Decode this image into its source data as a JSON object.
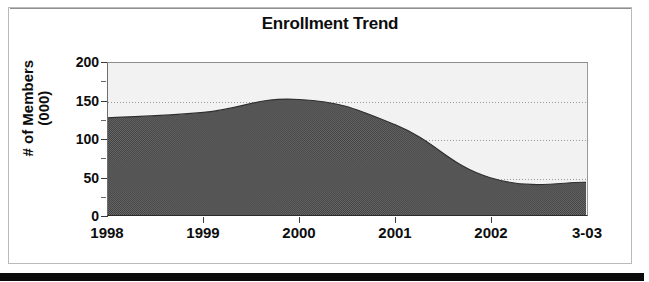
{
  "document": {
    "kind": "scanned-chart-page",
    "bottom_bar_color": "#0b0b0b",
    "frame_color": "#b9b9b9"
  },
  "chart_data": {
    "type": "area",
    "title": "Enrollment Trend",
    "xlabel": "",
    "ylabel": "# of Members\n(000)",
    "categories": [
      "1998",
      "1999",
      "2000",
      "2001",
      "2002",
      "3-03"
    ],
    "values": [
      128,
      135,
      152,
      119,
      49,
      43
    ],
    "ylim": [
      0,
      200
    ],
    "yticks": [
      0,
      50,
      100,
      150,
      200
    ],
    "ytick_labels": [
      "0",
      "50",
      "100",
      "150",
      "200"
    ],
    "yminor_ticks": [
      25,
      75,
      125,
      175
    ],
    "grid": "horizontal-dotted",
    "legend": "none",
    "series": [
      {
        "name": "Enrollment",
        "values": [
          128,
          135,
          152,
          119,
          49,
          43
        ],
        "fill_color": "#4d4d4d",
        "fill_pattern": "dithered-checker",
        "line_color": "#2b2b2b"
      }
    ],
    "plot_background": "#f2f2f2",
    "peak": {
      "category": "2000",
      "value": 152
    },
    "annotations": []
  },
  "axis": {
    "y_title_line1": "# of Members",
    "y_title_line2": "(000)"
  }
}
